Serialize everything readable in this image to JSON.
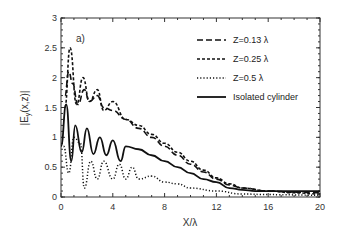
{
  "chart_data": {
    "type": "line",
    "panel_label": "a)",
    "title": "",
    "xlabel": "X/λ",
    "ylabel": "|E_y(x,z)|",
    "xlim": [
      0,
      20
    ],
    "ylim": [
      0,
      3
    ],
    "xticks": [
      "0",
      "4",
      "8",
      "12",
      "16",
      "20"
    ],
    "yticks": [
      "0",
      "0.5",
      "1",
      "1.5",
      "2",
      "2.5",
      "3"
    ],
    "grid": false,
    "legend_position": "upper right",
    "series": [
      {
        "name": "Z=0.13 λ",
        "style": "long-dash",
        "x": [
          0.3,
          0.6,
          0.9,
          1.3,
          1.8,
          2.2,
          2.8,
          3.3,
          4,
          5,
          6,
          7,
          8,
          9,
          10,
          11,
          12,
          13,
          14,
          16,
          18,
          20
        ],
        "y": [
          1.7,
          2.1,
          1.9,
          1.55,
          1.8,
          1.6,
          1.7,
          1.5,
          1.45,
          1.3,
          1.15,
          1.0,
          0.85,
          0.7,
          0.55,
          0.42,
          0.3,
          0.2,
          0.15,
          0.1,
          0.08,
          0.07
        ]
      },
      {
        "name": "Z=0.25 λ",
        "style": "short-dash",
        "x": [
          0.3,
          0.7,
          1.2,
          1.7,
          2.2,
          2.8,
          3.3,
          4,
          5,
          6,
          7,
          8,
          9,
          10,
          11,
          12,
          13,
          14,
          16,
          18,
          20
        ],
        "y": [
          1.5,
          2.5,
          1.55,
          2.0,
          1.6,
          1.8,
          1.45,
          1.6,
          1.3,
          1.2,
          1.05,
          0.9,
          0.75,
          0.6,
          0.45,
          0.32,
          0.22,
          0.15,
          0.1,
          0.07,
          0.05
        ]
      },
      {
        "name": "Z=0.5 λ",
        "style": "dotted",
        "x": [
          0.2,
          0.6,
          1.0,
          1.5,
          1.8,
          2.3,
          2.8,
          3.3,
          4,
          4.5,
          5,
          5.5,
          6,
          7,
          8,
          9,
          10,
          12,
          14,
          16,
          20
        ],
        "y": [
          0.85,
          0.4,
          1.0,
          0.9,
          0.15,
          0.6,
          0.3,
          0.6,
          0.3,
          0.55,
          0.3,
          0.5,
          0.3,
          0.35,
          0.25,
          0.22,
          0.15,
          0.1,
          0.05,
          0.04,
          0.03
        ]
      },
      {
        "name": "Isolated cylinder",
        "style": "solid",
        "x": [
          0.0,
          0.4,
          0.8,
          1.1,
          1.6,
          2.0,
          2.5,
          3.0,
          3.5,
          4.0,
          4.6,
          5.0,
          6.0,
          7.0,
          8.0,
          9.0,
          10.0,
          11.0,
          12.0,
          13.0,
          14.0,
          15.0,
          16.0,
          18.0,
          20.0
        ],
        "y": [
          0.85,
          1.55,
          0.6,
          1.2,
          0.75,
          1.15,
          0.72,
          1.0,
          0.7,
          0.95,
          0.6,
          0.85,
          0.8,
          0.7,
          0.6,
          0.5,
          0.4,
          0.3,
          0.25,
          0.15,
          0.12,
          0.1,
          0.1,
          0.1,
          0.1
        ]
      }
    ]
  }
}
